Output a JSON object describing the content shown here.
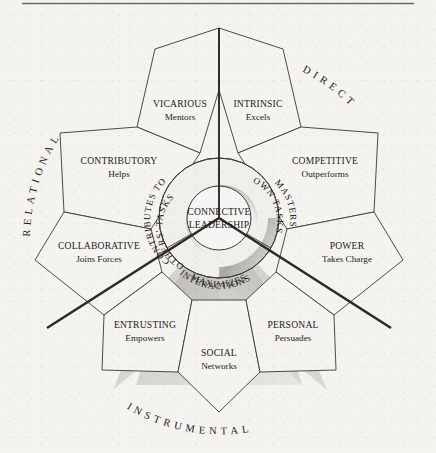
{
  "figure": {
    "center_inner": {
      "line1": "CONNECTIVE",
      "line2": "LEADERSHIP"
    },
    "rule_color": "#6d6a66",
    "ink_color": "#1d1b19",
    "paper_color": "#f4f3f0"
  },
  "rings": [
    {
      "id": "ring-relational",
      "text": "CONTRIBUTES TO",
      "text2": "OTHERS' TASKS"
    },
    {
      "id": "ring-direct",
      "text": "MASTERS",
      "text2": "OWN TASKS"
    },
    {
      "id": "ring-instrumental",
      "text": "MAXIMIZES",
      "text2": "INTERACTIONS"
    }
  ],
  "axes": [
    {
      "id": "axis-relational",
      "label": "RELATIONAL"
    },
    {
      "id": "axis-direct",
      "label": "DIRECT"
    },
    {
      "id": "axis-instrumental",
      "label": "INSTRUMENTAL"
    }
  ],
  "petals": [
    {
      "id": "petal-vicarious",
      "title": "VICARIOUS",
      "sub": "Mentors",
      "domain": "Relational"
    },
    {
      "id": "petal-contributory",
      "title": "CONTRIBUTORY",
      "sub": "Helps",
      "domain": "Relational"
    },
    {
      "id": "petal-collaborative",
      "title": "COLLABORATIVE",
      "sub": "Joins Forces",
      "domain": "Relational"
    },
    {
      "id": "petal-intrinsic",
      "title": "INTRINSIC",
      "sub": "Excels",
      "domain": "Direct"
    },
    {
      "id": "petal-competitive",
      "title": "COMPETITIVE",
      "sub": "Outperforms",
      "domain": "Direct"
    },
    {
      "id": "petal-power",
      "title": "POWER",
      "sub": "Takes Charge",
      "domain": "Direct"
    },
    {
      "id": "petal-entrusting",
      "title": "ENTRUSTING",
      "sub": "Empowers",
      "domain": "Instrumental"
    },
    {
      "id": "petal-social",
      "title": "SOCIAL",
      "sub": "Networks",
      "domain": "Instrumental"
    },
    {
      "id": "petal-personal",
      "title": "PERSONAL",
      "sub": "Persuades",
      "domain": "Instrumental"
    }
  ]
}
